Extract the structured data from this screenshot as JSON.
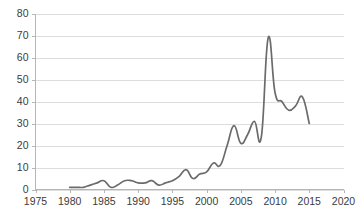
{
  "chart_data": {
    "type": "line",
    "title": "",
    "subtitle": "",
    "xlabel": "",
    "ylabel": "",
    "xlim": [
      1975,
      2020
    ],
    "ylim": [
      0,
      80
    ],
    "grid": true,
    "legend": false,
    "legend_position": "none",
    "line_color": "#6b6b6b",
    "grid_color": "#d4d4d4",
    "axis_color": "#b6b6b6",
    "tick_text_color": "#3b3b3b",
    "x_ticks": [
      1975,
      1980,
      1985,
      1990,
      1995,
      2000,
      2005,
      2010,
      2015,
      2020
    ],
    "y_ticks": [
      0,
      10,
      20,
      30,
      40,
      50,
      60,
      70,
      80
    ],
    "x_tick_labels": [
      "1975",
      "1980",
      "1985",
      "1990",
      "1995",
      "2000",
      "2005",
      "2010",
      "2015",
      "2020"
    ],
    "y_tick_labels": [
      "0",
      "10",
      "20",
      "30",
      "40",
      "50",
      "60",
      "70",
      "80"
    ],
    "series": [
      {
        "name": "series-1",
        "x": [
          1980,
          1981,
          1982,
          1983,
          1984,
          1985,
          1986,
          1987,
          1988,
          1989,
          1990,
          1991,
          1992,
          1993,
          1994,
          1995,
          1996,
          1997,
          1998,
          1999,
          2000,
          2001,
          2002,
          2003,
          2004,
          2005,
          2006,
          2007,
          2008,
          2009,
          2010,
          2011,
          2012,
          2013,
          2014,
          2015
        ],
        "values": [
          1,
          1,
          1,
          2,
          3,
          4,
          1,
          2,
          4,
          4,
          3,
          3,
          4,
          2,
          3,
          4,
          6,
          9,
          5,
          7,
          8,
          12,
          11,
          20,
          29,
          21,
          25,
          31,
          24,
          69,
          44,
          40,
          36,
          38,
          42,
          30
        ]
      }
    ]
  }
}
